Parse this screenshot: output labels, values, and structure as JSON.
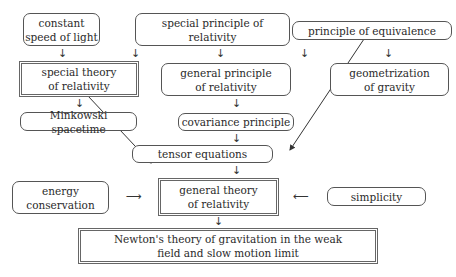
{
  "diagram": {
    "nodes": {
      "constant_speed": "constant speed of light",
      "special_principle": "special principle of relativity",
      "equivalence": "principle of equivalence",
      "special_theory": "special theory of relativity",
      "general_principle": "general principle of relativity",
      "geometrization": "geometrization of gravity",
      "minkowski": "Minkowski spacetime",
      "covariance": "covariance principle",
      "tensor": "tensor equations",
      "energy": "energy conservation",
      "general_theory": "general theory of relativity",
      "simplicity": "simplicity",
      "newton": "Newton's theory of gravitation in the weak field and slow motion limit"
    },
    "arrows": {
      "down": "↓",
      "right": "⟶",
      "left": "⟵"
    },
    "edges": [
      [
        "constant speed of light",
        "special theory of relativity"
      ],
      [
        "special principle of relativity",
        "special theory of relativity"
      ],
      [
        "special principle of relativity",
        "general principle of relativity"
      ],
      [
        "principle of equivalence",
        "general principle of relativity"
      ],
      [
        "principle of equivalence",
        "geometrization of gravity"
      ],
      [
        "special theory of relativity",
        "Minkowski spacetime"
      ],
      [
        "special theory of relativity",
        "tensor equations"
      ],
      [
        "general principle of relativity",
        "covariance principle"
      ],
      [
        "covariance principle",
        "tensor equations"
      ],
      [
        "principle of equivalence",
        "tensor equations"
      ],
      [
        "tensor equations",
        "general theory of relativity"
      ],
      [
        "energy conservation",
        "general theory of relativity"
      ],
      [
        "simplicity",
        "general theory of relativity"
      ],
      [
        "general theory of relativity",
        "Newton's theory of gravitation in the weak field and slow motion limit"
      ]
    ]
  }
}
